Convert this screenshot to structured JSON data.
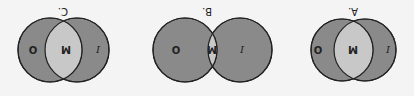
{
  "figure": {
    "orientation": "rotated-180",
    "colors": {
      "background": "#f4f4f4",
      "outer_fill": "#8a8a8a",
      "overlap_fill": "#c8c8c8",
      "stroke": "#222222"
    },
    "diagrams": [
      {
        "label": "A.",
        "left_region": "I",
        "overlap_region": "M",
        "right_region": "O",
        "overlap_size": "large"
      },
      {
        "label": "B.",
        "left_region": "I",
        "overlap_region": "M",
        "right_region": "O",
        "overlap_size": "small"
      },
      {
        "label": "C.",
        "left_region": "I",
        "overlap_region": "M",
        "right_region": "O",
        "overlap_size": "medium"
      }
    ]
  }
}
